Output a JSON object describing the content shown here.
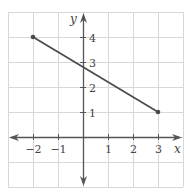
{
  "chart_data": {
    "type": "line",
    "title": "",
    "xlabel": "x",
    "ylabel": "y",
    "xlim": [
      -3,
      4
    ],
    "ylim": [
      -2,
      5
    ],
    "grid": true,
    "x_ticks": [
      -2,
      -1,
      1,
      2,
      3
    ],
    "y_ticks": [
      1,
      2,
      3,
      4
    ],
    "x_tick_labels": [
      "−2",
      "−1",
      "1",
      "2",
      "3"
    ],
    "y_tick_labels": [
      "1",
      "2",
      "3",
      "4"
    ],
    "series": [
      {
        "name": "segment",
        "points": [
          {
            "x": -2,
            "y": 4
          },
          {
            "x": 3,
            "y": 1
          }
        ],
        "endpoints_marked": true
      }
    ]
  },
  "colors": {
    "grid": "#d8d8d8",
    "axis": "#555555",
    "line": "#4a4a4a"
  }
}
